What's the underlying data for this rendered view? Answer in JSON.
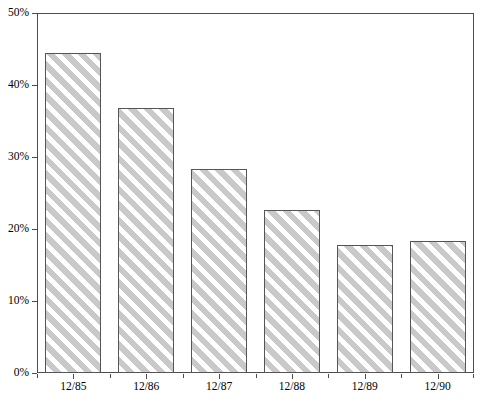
{
  "chart_data": {
    "type": "bar",
    "title": "",
    "subtitle": "",
    "xlabel": "",
    "ylabel": "",
    "categories": [
      "12/85",
      "12/86",
      "12/87",
      "12/88",
      "12/89",
      "12/90"
    ],
    "values": [
      44.4,
      36.8,
      28.4,
      22.6,
      17.8,
      18.3
    ],
    "series": [
      {
        "name": "",
        "values": [
          44.4,
          36.8,
          28.4,
          22.6,
          17.8,
          18.3
        ]
      }
    ],
    "ylim": [
      0,
      50
    ],
    "xlim_categories": 6,
    "y_ticks": [
      0,
      10,
      20,
      30,
      40,
      50
    ],
    "y_tick_labels": [
      "0%",
      "10%",
      "20%",
      "30%",
      "40%",
      "50%"
    ],
    "x_tick_labels": [
      "12/85",
      "12/86",
      "12/87",
      "12/88",
      "12/89",
      "12/90"
    ],
    "grid": false,
    "legend": false,
    "legend_position": "none",
    "value_format": "percent",
    "bar_style": {
      "fill": "#ffffff",
      "hatch": "diagonal-stripes",
      "hatch_color": "#c9c9c9",
      "border_color": "#555555"
    },
    "axis_color": "#4d4d4d",
    "background": "#ffffff"
  }
}
